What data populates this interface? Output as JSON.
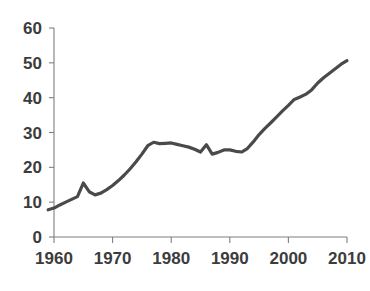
{
  "chart_data": {
    "type": "line",
    "title": "",
    "subtitle": "",
    "xlabel": "",
    "ylabel": "",
    "xlim": [
      1959,
      2011
    ],
    "ylim": [
      0,
      60
    ],
    "grid": false,
    "legend": null,
    "legend_position": "none",
    "annotations": [],
    "series": [
      {
        "name": "series-1",
        "color": "#4a4a4a",
        "line_width": 3.2,
        "x": [
          1959,
          1960,
          1961,
          1962,
          1963,
          1964,
          1965,
          1966,
          1967,
          1968,
          1969,
          1970,
          1971,
          1972,
          1973,
          1974,
          1975,
          1976,
          1977,
          1978,
          1979,
          1980,
          1981,
          1982,
          1983,
          1984,
          1985,
          1986,
          1987,
          1988,
          1989,
          1990,
          1991,
          1992,
          1993,
          1994,
          1995,
          1996,
          1997,
          1998,
          1999,
          2000,
          2001,
          2002,
          2003,
          2004,
          2005,
          2006,
          2007,
          2008,
          2009,
          2010
        ],
        "values": [
          7.8,
          8.3,
          9.2,
          10.0,
          10.8,
          11.6,
          15.5,
          13.0,
          12.1,
          12.6,
          13.6,
          14.8,
          16.2,
          17.8,
          19.6,
          21.6,
          23.8,
          26.2,
          27.2,
          26.8,
          26.9,
          27.0,
          26.6,
          26.2,
          25.8,
          25.2,
          24.4,
          26.5,
          23.8,
          24.3,
          25.0,
          25.0,
          24.6,
          24.4,
          25.4,
          27.3,
          29.4,
          31.2,
          32.8,
          34.5,
          36.2,
          37.8,
          39.5,
          40.2,
          41.0,
          42.3,
          44.2,
          45.7,
          47.0,
          48.3,
          49.6,
          50.6
        ]
      }
    ],
    "x_axis": {
      "ticks": [
        1960,
        1970,
        1980,
        1990,
        2000,
        2010
      ],
      "tick_labels": [
        "1960",
        "1970",
        "1980",
        "1990",
        "2000",
        "2010"
      ]
    },
    "y_axis": {
      "ticks": [
        0,
        10,
        20,
        30,
        40,
        50,
        60
      ],
      "tick_labels": [
        "0",
        "10",
        "20",
        "30",
        "40",
        "50",
        "60"
      ]
    },
    "style": {
      "axis_color": "#7f7f7f",
      "label_color": "#3c3c3c",
      "background": "#ffffff"
    }
  },
  "caption": {
    "text": ""
  }
}
